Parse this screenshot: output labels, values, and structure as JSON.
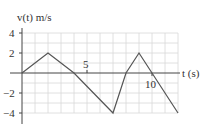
{
  "chart_data": {
    "type": "line",
    "title": "",
    "ylabel": "v(t) m/s",
    "xlabel": "t (s)",
    "x": [
      0,
      2,
      4,
      7,
      8,
      9,
      12
    ],
    "series": [
      {
        "name": "v(t)",
        "values": [
          0,
          2,
          0,
          -4,
          0,
          2,
          -4
        ]
      }
    ],
    "xlim": [
      0,
      12
    ],
    "ylim": [
      -5,
      5
    ],
    "xticks": [
      5,
      10
    ],
    "yticks": [
      4,
      2,
      -2,
      -4
    ],
    "ytick_labels": [
      "4",
      "2",
      "−2",
      "−4"
    ],
    "xtick_labels": [
      "5",
      "10"
    ],
    "grid": true
  },
  "labels": {
    "y_axis": "v(t) m/s",
    "x_axis": "t (s)",
    "y4": "4",
    "y2": "2",
    "ym2": "−2",
    "ym4": "−4",
    "x5": "5",
    "x10": "10"
  }
}
